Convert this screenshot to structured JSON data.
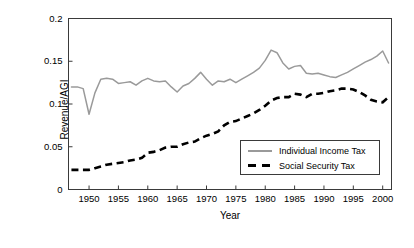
{
  "chart_data": {
    "type": "line",
    "title": "",
    "xlabel": "Year",
    "ylabel": "Revenue/AGI",
    "xlim": [
      1946.5,
      2001.5
    ],
    "ylim": [
      0,
      0.2
    ],
    "grid": false,
    "legend_position": "inside-bottom-right",
    "xticks": [
      1950,
      1955,
      1960,
      1965,
      1970,
      1975,
      1980,
      1985,
      1990,
      1995,
      2000
    ],
    "xtick_labels": [
      "1950",
      "1955",
      "1960",
      "1965",
      "1970",
      "1975",
      "1980",
      "1985",
      "1990",
      "1995",
      "2000"
    ],
    "yticks": [
      0,
      0.05,
      0.1,
      0.15,
      0.2
    ],
    "ytick_labels": [
      "0",
      "0.05",
      "0.1",
      "0.15",
      "0.2"
    ],
    "colors": {
      "individual_income_tax": "#9a9a9a",
      "social_security_tax": "#000000"
    },
    "x": [
      1947,
      1948,
      1949,
      1950,
      1951,
      1952,
      1953,
      1954,
      1955,
      1956,
      1957,
      1958,
      1959,
      1960,
      1961,
      1962,
      1963,
      1964,
      1965,
      1966,
      1967,
      1968,
      1969,
      1970,
      1971,
      1972,
      1973,
      1974,
      1975,
      1976,
      1977,
      1978,
      1979,
      1980,
      1981,
      1982,
      1983,
      1984,
      1985,
      1986,
      1987,
      1988,
      1989,
      1990,
      1991,
      1992,
      1993,
      1994,
      1995,
      1996,
      1997,
      1998,
      1999,
      2000,
      2001
    ],
    "series": [
      {
        "name": "Individual Income Tax",
        "style": "solid",
        "color": "#9a9a9a",
        "values": [
          0.12,
          0.12,
          0.118,
          0.088,
          0.113,
          0.129,
          0.13,
          0.129,
          0.124,
          0.125,
          0.126,
          0.122,
          0.127,
          0.13,
          0.127,
          0.126,
          0.127,
          0.12,
          0.114,
          0.121,
          0.124,
          0.13,
          0.137,
          0.129,
          0.122,
          0.127,
          0.126,
          0.129,
          0.125,
          0.129,
          0.133,
          0.137,
          0.142,
          0.151,
          0.163,
          0.16,
          0.148,
          0.141,
          0.144,
          0.145,
          0.136,
          0.135,
          0.136,
          0.134,
          0.132,
          0.131,
          0.134,
          0.137,
          0.141,
          0.145,
          0.149,
          0.152,
          0.156,
          0.162,
          0.148
        ]
      },
      {
        "name": "Social Security Tax",
        "style": "dashed",
        "color": "#000000",
        "values": [
          0.023,
          0.023,
          0.023,
          0.023,
          0.025,
          0.027,
          0.029,
          0.03,
          0.031,
          0.032,
          0.034,
          0.035,
          0.037,
          0.043,
          0.044,
          0.046,
          0.049,
          0.05,
          0.05,
          0.053,
          0.055,
          0.056,
          0.06,
          0.063,
          0.065,
          0.068,
          0.075,
          0.079,
          0.08,
          0.083,
          0.086,
          0.089,
          0.093,
          0.098,
          0.104,
          0.107,
          0.108,
          0.108,
          0.112,
          0.111,
          0.108,
          0.112,
          0.112,
          0.113,
          0.115,
          0.116,
          0.118,
          0.118,
          0.117,
          0.114,
          0.11,
          0.105,
          0.103,
          0.102,
          0.108
        ]
      }
    ]
  },
  "axis": {
    "ylabel": "Revenue/AGI",
    "xlabel": "Year"
  },
  "legend": {
    "items": [
      {
        "label": "Individual Income Tax"
      },
      {
        "label": "Social Security Tax"
      }
    ]
  }
}
